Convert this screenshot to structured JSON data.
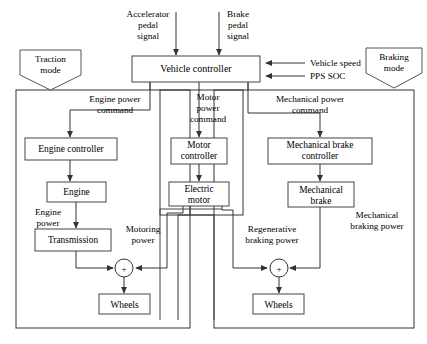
{
  "diagram": {
    "type": "block-diagram"
  },
  "inputs": {
    "accelerator": {
      "line1": "Accelerator",
      "line2": "pedal",
      "line3": "signal"
    },
    "brake": {
      "line1": "Brake",
      "line2": "pedal",
      "line3": "signal"
    },
    "vehicle_speed": "Vehicle speed",
    "pps_soc": "PPS SOC"
  },
  "controller": {
    "label": "Vehicle controller"
  },
  "modes": {
    "traction": {
      "line1": "Traction",
      "line2": "mode"
    },
    "braking": {
      "line1": "Braking",
      "line2": "mode"
    }
  },
  "commands": {
    "engine_power": {
      "line1": "Engine power",
      "line2": "command"
    },
    "motor_power": {
      "line1": "Motor",
      "line2": "power",
      "line3": "command"
    },
    "mechanical_power": {
      "line1": "Mechanical power",
      "line2": "command"
    }
  },
  "blocks": {
    "engine_controller": {
      "line1": "Engine controller"
    },
    "engine": {
      "line1": "Engine"
    },
    "transmission": {
      "line1": "Transmission"
    },
    "motor_controller": {
      "line1": "Motor",
      "line2": "controller"
    },
    "electric_motor": {
      "line1": "Electric",
      "line2": "motor"
    },
    "mech_brake_controller": {
      "line1": "Mechanical brake",
      "line2": "controller"
    },
    "mech_brake": {
      "line1": "Mechanical",
      "line2": "brake"
    },
    "wheels_left": {
      "line1": "Wheels"
    },
    "wheels_right": {
      "line1": "Wheels"
    }
  },
  "power_labels": {
    "engine_power": {
      "line1": "Engine",
      "line2": "power"
    },
    "motoring_power": {
      "line1": "Motoring",
      "line2": "power"
    },
    "regenerative_braking_power": {
      "line1": "Regenerative",
      "line2": "braking power"
    },
    "mechanical_braking_power": {
      "line1": "Mechanical",
      "line2": "braking power"
    }
  },
  "junctions": {
    "traction_sum": "+",
    "braking_sum": "+"
  },
  "colors": {
    "background": "#ffffff",
    "stroke": "#333333",
    "box_stroke": "#444444",
    "text": "#000000"
  }
}
